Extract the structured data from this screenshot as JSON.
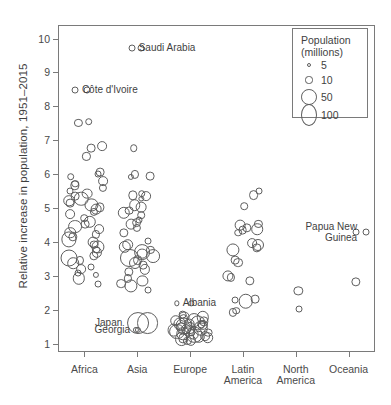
{
  "chart_data": {
    "type": "scatter",
    "title": "",
    "xlabel": "",
    "ylabel": "Relative increase in population, 1951–2015",
    "categories": [
      "Africa",
      "Asia",
      "Europe",
      "Latin America",
      "North America",
      "Oceania"
    ],
    "ylim": [
      0.75,
      10.4
    ],
    "yticks": [
      1,
      2,
      3,
      4,
      5,
      6,
      7,
      8,
      9,
      10
    ],
    "grid": false,
    "size_encoding": {
      "variable": "Population (millions)",
      "legend_values": [
        5,
        10,
        50,
        100
      ],
      "legend_position": "top-right"
    },
    "annotations": [
      {
        "label": "Saudi Arabia",
        "category": "Asia",
        "value": 9.75,
        "size": 5,
        "label_side": "right"
      },
      {
        "label": "Côte d'Ivoire",
        "category": "Africa",
        "value": 8.5,
        "size": 5,
        "label_side": "right"
      },
      {
        "label": "Albania",
        "category": "Europe",
        "value": 2.22,
        "size": 3,
        "label_side": "right"
      },
      {
        "label": "Japan",
        "category": "Asia",
        "value": 1.63,
        "size": 50,
        "label_side": "left"
      },
      {
        "label": "Georgia",
        "category": "Asia",
        "value": 1.42,
        "size": 4,
        "label_side": "left"
      },
      {
        "label": "Papua New\nGuinea",
        "category": "Oceania",
        "value": 4.32,
        "size": 5,
        "label_side": "left"
      }
    ],
    "series": [
      {
        "name": "Africa",
        "points": [
          {
            "v": 7.58,
            "s": 6
          },
          {
            "v": 7.55,
            "s": 7
          },
          {
            "v": 8.5,
            "s": 5
          },
          {
            "v": 6.85,
            "s": 10
          },
          {
            "v": 6.8,
            "s": 8
          },
          {
            "v": 6.55,
            "s": 7
          },
          {
            "v": 6.02,
            "s": 5
          },
          {
            "v": 6.08,
            "s": 8
          },
          {
            "v": 5.95,
            "s": 6
          },
          {
            "v": 5.82,
            "s": 10
          },
          {
            "v": 5.75,
            "s": 6
          },
          {
            "v": 5.7,
            "s": 9
          },
          {
            "v": 5.62,
            "s": 7
          },
          {
            "v": 5.52,
            "s": 5
          },
          {
            "v": 5.3,
            "s": 22
          },
          {
            "v": 5.25,
            "s": 14
          },
          {
            "v": 5.18,
            "s": 8
          },
          {
            "v": 5.12,
            "s": 18
          },
          {
            "v": 5.05,
            "s": 9
          },
          {
            "v": 5.0,
            "s": 12
          },
          {
            "v": 4.92,
            "s": 7
          },
          {
            "v": 4.85,
            "s": 10
          },
          {
            "v": 4.62,
            "s": 16
          },
          {
            "v": 4.55,
            "s": 8
          },
          {
            "v": 4.48,
            "s": 20
          },
          {
            "v": 4.4,
            "s": 10
          },
          {
            "v": 4.3,
            "s": 14
          },
          {
            "v": 4.25,
            "s": 7
          },
          {
            "v": 4.18,
            "s": 9
          },
          {
            "v": 4.1,
            "s": 24
          },
          {
            "v": 4.02,
            "s": 12
          },
          {
            "v": 3.95,
            "s": 8
          },
          {
            "v": 3.88,
            "s": 18
          },
          {
            "v": 3.8,
            "s": 6
          },
          {
            "v": 3.72,
            "s": 11
          },
          {
            "v": 3.62,
            "s": 9
          },
          {
            "v": 3.55,
            "s": 30
          },
          {
            "v": 3.48,
            "s": 7
          },
          {
            "v": 3.4,
            "s": 14
          },
          {
            "v": 3.3,
            "s": 5
          },
          {
            "v": 3.22,
            "s": 10
          },
          {
            "v": 3.12,
            "s": 5
          },
          {
            "v": 3.05,
            "s": 4
          },
          {
            "v": 2.95,
            "s": 16
          },
          {
            "v": 2.78,
            "s": 5
          },
          {
            "v": 5.45,
            "s": 12
          },
          {
            "v": 5.38,
            "s": 8
          },
          {
            "v": 4.72,
            "s": 6
          }
        ]
      },
      {
        "name": "Asia",
        "points": [
          {
            "v": 9.75,
            "s": 5
          },
          {
            "v": 6.02,
            "s": 7
          },
          {
            "v": 5.95,
            "s": 4
          },
          {
            "v": 5.98,
            "s": 8
          },
          {
            "v": 5.45,
            "s": 6
          },
          {
            "v": 5.4,
            "s": 9
          },
          {
            "v": 5.38,
            "s": 10
          },
          {
            "v": 5.3,
            "s": 3
          },
          {
            "v": 5.12,
            "s": 14
          },
          {
            "v": 5.05,
            "s": 12
          },
          {
            "v": 4.95,
            "s": 8
          },
          {
            "v": 4.88,
            "s": 16
          },
          {
            "v": 4.82,
            "s": 6
          },
          {
            "v": 4.68,
            "s": 5
          },
          {
            "v": 4.6,
            "s": 10
          },
          {
            "v": 4.55,
            "s": 12
          },
          {
            "v": 4.45,
            "s": 7
          },
          {
            "v": 4.3,
            "s": 9
          },
          {
            "v": 4.05,
            "s": 5
          },
          {
            "v": 3.95,
            "s": 14
          },
          {
            "v": 3.88,
            "s": 16
          },
          {
            "v": 3.8,
            "s": 7
          },
          {
            "v": 3.72,
            "s": 26
          },
          {
            "v": 3.68,
            "s": 12
          },
          {
            "v": 3.6,
            "s": 20
          },
          {
            "v": 3.55,
            "s": 34
          },
          {
            "v": 3.5,
            "s": 10
          },
          {
            "v": 3.42,
            "s": 15
          },
          {
            "v": 3.35,
            "s": 8
          },
          {
            "v": 3.22,
            "s": 11
          },
          {
            "v": 3.15,
            "s": 9
          },
          {
            "v": 2.95,
            "s": 7
          },
          {
            "v": 2.88,
            "s": 13
          },
          {
            "v": 2.8,
            "s": 10
          },
          {
            "v": 2.72,
            "s": 18
          },
          {
            "v": 2.6,
            "s": 5
          },
          {
            "v": 1.63,
            "s": 50
          },
          {
            "v": 1.42,
            "s": 4
          },
          {
            "v": 6.8,
            "s": 6
          }
        ]
      },
      {
        "name": "Europe",
        "points": [
          {
            "v": 2.22,
            "s": 3
          },
          {
            "v": 1.88,
            "s": 8
          },
          {
            "v": 1.82,
            "s": 12
          },
          {
            "v": 1.8,
            "s": 16
          },
          {
            "v": 1.75,
            "s": 10
          },
          {
            "v": 1.72,
            "s": 20
          },
          {
            "v": 1.7,
            "s": 14
          },
          {
            "v": 1.68,
            "s": 9
          },
          {
            "v": 1.65,
            "s": 24
          },
          {
            "v": 1.62,
            "s": 12
          },
          {
            "v": 1.6,
            "s": 18
          },
          {
            "v": 1.58,
            "s": 11
          },
          {
            "v": 1.55,
            "s": 30
          },
          {
            "v": 1.52,
            "s": 9
          },
          {
            "v": 1.5,
            "s": 15
          },
          {
            "v": 1.48,
            "s": 22
          },
          {
            "v": 1.45,
            "s": 10
          },
          {
            "v": 1.42,
            "s": 17
          },
          {
            "v": 1.4,
            "s": 13
          },
          {
            "v": 1.38,
            "s": 26
          },
          {
            "v": 1.35,
            "s": 8
          },
          {
            "v": 1.32,
            "s": 19
          },
          {
            "v": 1.3,
            "s": 12
          },
          {
            "v": 1.28,
            "s": 28
          },
          {
            "v": 1.25,
            "s": 10
          },
          {
            "v": 1.22,
            "s": 16
          },
          {
            "v": 1.2,
            "s": 14
          },
          {
            "v": 1.18,
            "s": 9
          },
          {
            "v": 1.15,
            "s": 20
          },
          {
            "v": 1.12,
            "s": 11
          },
          {
            "v": 1.1,
            "s": 7
          },
          {
            "v": 1.6,
            "s": 6
          },
          {
            "v": 1.35,
            "s": 6
          }
        ]
      },
      {
        "name": "Latin America",
        "points": [
          {
            "v": 5.52,
            "s": 5
          },
          {
            "v": 5.42,
            "s": 10
          },
          {
            "v": 5.08,
            "s": 6
          },
          {
            "v": 4.55,
            "s": 7
          },
          {
            "v": 4.52,
            "s": 12
          },
          {
            "v": 4.45,
            "s": 9
          },
          {
            "v": 4.4,
            "s": 14
          },
          {
            "v": 4.38,
            "s": 8
          },
          {
            "v": 4.3,
            "s": 6
          },
          {
            "v": 4.0,
            "s": 10
          },
          {
            "v": 3.95,
            "s": 15
          },
          {
            "v": 3.85,
            "s": 9
          },
          {
            "v": 3.8,
            "s": 18
          },
          {
            "v": 3.5,
            "s": 8
          },
          {
            "v": 3.42,
            "s": 10
          },
          {
            "v": 3.02,
            "s": 13
          },
          {
            "v": 2.98,
            "s": 7
          },
          {
            "v": 2.88,
            "s": 9
          },
          {
            "v": 2.35,
            "s": 8
          },
          {
            "v": 2.3,
            "s": 5
          },
          {
            "v": 2.28,
            "s": 22
          },
          {
            "v": 2.0,
            "s": 6
          },
          {
            "v": 1.95,
            "s": 7
          }
        ]
      },
      {
        "name": "North America",
        "points": [
          {
            "v": 2.58,
            "s": 9
          },
          {
            "v": 2.05,
            "s": 5
          }
        ]
      },
      {
        "name": "Oceania",
        "points": [
          {
            "v": 2.85,
            "s": 9
          },
          {
            "v": 4.32,
            "s": 5
          }
        ]
      }
    ]
  }
}
